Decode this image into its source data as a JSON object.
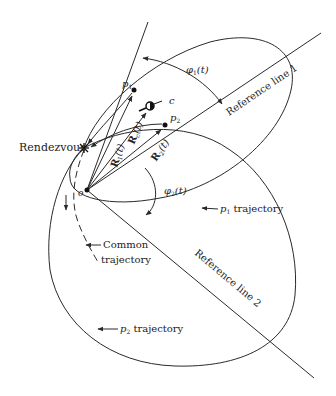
{
  "diagram": {
    "labels": {
      "rendezvous": "Rendezvous",
      "origin": "o",
      "p1": "p",
      "p1_sub": "1",
      "p2": "p",
      "p2_sub": "2",
      "c": "c",
      "R1": "R",
      "R1_sub": "1",
      "R1_arg": "(t)",
      "Rc": "R",
      "Rc_sub": "c",
      "Rc_arg": "(t)",
      "R2": "R",
      "R2_sub": "2",
      "R2_arg": "(t)",
      "phi1": "φ",
      "phi1_sub": "1",
      "phi1_arg": "(t)",
      "phi2": "φ",
      "phi2_sub": "2",
      "phi2_arg": "(t)",
      "ref_line_1": "Reference line 1",
      "ref_line_2": "Reference line 2",
      "p1_traj_p": "p",
      "p1_traj_sub": "1",
      "p1_traj_text": " trajectory",
      "p2_traj_p": "p",
      "p2_traj_sub": "2",
      "p2_traj_text": " trajectory",
      "common_1": "Common",
      "common_2": "trajectory"
    },
    "colors": {
      "line": "#2a2a2a",
      "background": "#ffffff"
    }
  }
}
